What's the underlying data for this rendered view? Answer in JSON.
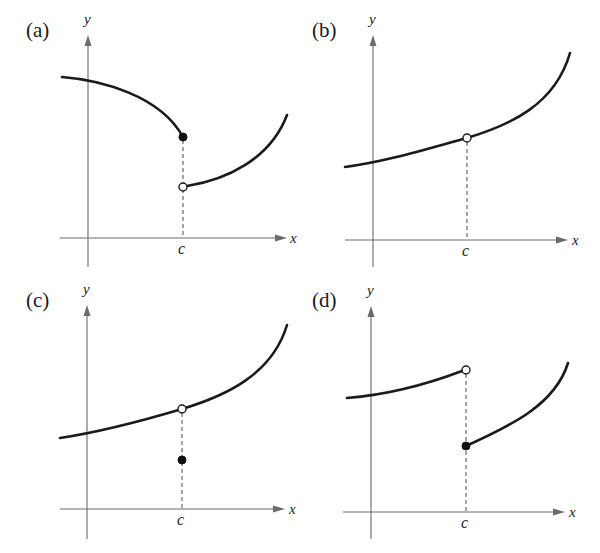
{
  "figure": {
    "panels": [
      {
        "id": "a",
        "label": "(a)",
        "x_axis_label": "x",
        "y_axis_label": "y",
        "c_label": "c",
        "description": "Jump discontinuity at c: left branch decreasing ending in filled dot, right branch starting at open circle below and increasing"
      },
      {
        "id": "b",
        "label": "(b)",
        "x_axis_label": "x",
        "y_axis_label": "y",
        "c_label": "c",
        "description": "Removable discontinuity at c: increasing curve with open circle at c, f(c) undefined"
      },
      {
        "id": "c",
        "label": "(c)",
        "x_axis_label": "x",
        "y_axis_label": "y",
        "c_label": "c",
        "description": "Removable discontinuity at c: increasing curve with open circle at c, filled dot below defining f(c)"
      },
      {
        "id": "d",
        "label": "(d)",
        "x_axis_label": "x",
        "y_axis_label": "y",
        "c_label": "c",
        "description": "Jump discontinuity at c: left branch ends in open circle, right branch starts at filled dot below"
      }
    ],
    "colors": {
      "curve": "#1a1a1a",
      "axis": "#6b6b6b",
      "background": "#ffffff"
    }
  }
}
